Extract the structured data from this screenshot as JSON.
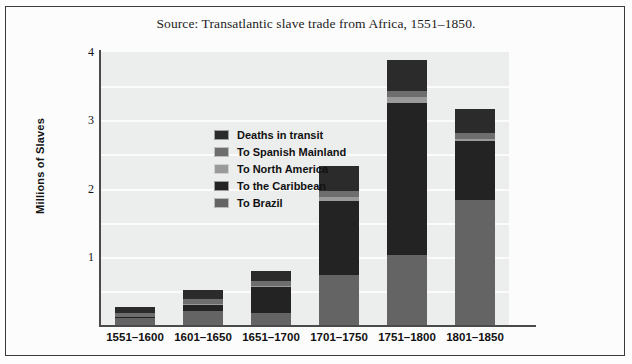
{
  "caption": "Source: Transatlantic slave trade from Africa, 1551–1850.",
  "axis": {
    "ylabel": "Millions of Slaves",
    "yticks": [
      "1",
      "2",
      "3",
      "4"
    ]
  },
  "legend": {
    "items": [
      {
        "label": "Deaths in transit",
        "color": "#2b2b2b",
        "key": "deaths_in_transit"
      },
      {
        "label": "To Spanish Mainland",
        "color": "#6e6e6e",
        "key": "to_spanish_mainland"
      },
      {
        "label": "To North America",
        "color": "#9a9a9a",
        "key": "to_north_america"
      },
      {
        "label": "To the Caribbean",
        "color": "#232323",
        "key": "to_the_caribbean"
      },
      {
        "label": "To Brazil",
        "color": "#646464",
        "key": "to_brazil"
      }
    ]
  },
  "chart_data": {
    "type": "bar",
    "title": "Source: Transatlantic slave trade from Africa, 1551–1850.",
    "xlabel": "",
    "ylabel": "Millions of Slaves",
    "ylim": [
      0,
      4
    ],
    "yticks": [
      1,
      2,
      3,
      4
    ],
    "grid": true,
    "stacked": true,
    "legend_position": "upper-left-inside",
    "categories": [
      "1551–1600",
      "1601–1650",
      "1651–1700",
      "1701–1750",
      "1751–1800",
      "1801–1850"
    ],
    "series": [
      {
        "name": "To Brazil",
        "color": "#646464",
        "values": [
          0.1,
          0.2,
          0.18,
          0.73,
          1.03,
          1.83
        ]
      },
      {
        "name": "To the Caribbean",
        "color": "#232323",
        "values": [
          0.02,
          0.1,
          0.37,
          1.08,
          2.23,
          0.87
        ]
      },
      {
        "name": "To North America",
        "color": "#9a9a9a",
        "values": [
          0.0,
          0.01,
          0.02,
          0.07,
          0.08,
          0.02
        ]
      },
      {
        "name": "To Spanish Mainland",
        "color": "#6e6e6e",
        "values": [
          0.06,
          0.07,
          0.07,
          0.09,
          0.09,
          0.1
        ]
      },
      {
        "name": "Deaths in transit",
        "color": "#2b2b2b",
        "values": [
          0.09,
          0.14,
          0.15,
          0.36,
          0.45,
          0.35
        ]
      }
    ],
    "totals": [
      0.27,
      0.52,
      0.79,
      2.33,
      3.88,
      3.17
    ]
  }
}
